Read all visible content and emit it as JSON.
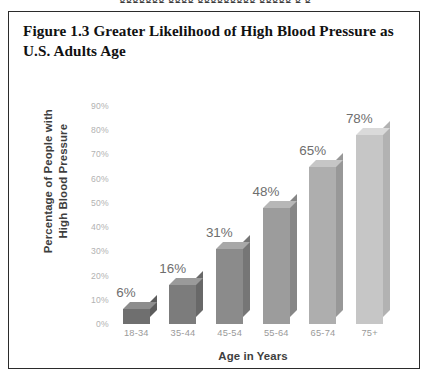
{
  "page": {
    "bleed_text_top": "ggggggg gggg ggggggggg  ggggg  g g"
  },
  "figure": {
    "caption": "Figure 1.3 Greater Likelihood of High Blood Pressure as U.S. Adults Age",
    "border_color": "#2b2b2b",
    "background": "#ffffff"
  },
  "chart_data": {
    "type": "bar",
    "title": "Figure 1.3 Greater Likelihood of High Blood Pressure as U.S. Adults Age",
    "subtitle": "",
    "xlabel": "Age in Years",
    "ylabel": "Percentage of People with High Blood Pressure",
    "ylabel_lines": [
      "Percentage of People with",
      "High Blood Pressure"
    ],
    "categories": [
      "18-34",
      "35-44",
      "45-54",
      "55-64",
      "65-74",
      "75+"
    ],
    "values": [
      6,
      16,
      31,
      48,
      65,
      78
    ],
    "data_labels": [
      "6%",
      "16%",
      "31%",
      "48%",
      "65%",
      "78%"
    ],
    "ylim": [
      0,
      90
    ],
    "ytick_values": [
      0,
      10,
      20,
      30,
      40,
      50,
      60,
      70,
      80,
      90
    ],
    "ytick_labels": [
      "0%",
      "10%",
      "20%",
      "30%",
      "40%",
      "50%",
      "60%",
      "70%",
      "80%",
      "90%"
    ],
    "grid": false,
    "legend": false,
    "legend_position": "none",
    "style": "3d-columns",
    "bar_colors": [
      "#6f6f6f",
      "#7c7c7c",
      "#8b8b8b",
      "#9c9c9c",
      "#aeaeae",
      "#c6c6c6"
    ],
    "bar_top_colors": [
      "#8d8d8d",
      "#9a9a9a",
      "#a8a8a8",
      "#b7b7b7",
      "#c6c6c6",
      "#dadada"
    ],
    "bar_side_colors": [
      "#5c5c5c",
      "#686868",
      "#767676",
      "#868686",
      "#989898",
      "#b2b2b2"
    ],
    "label_color": "#6e6e6e",
    "tick_color": "#b2b2b2",
    "xtick_color": "#9a9a9a",
    "axis_title_color": "#3e3e3e"
  }
}
